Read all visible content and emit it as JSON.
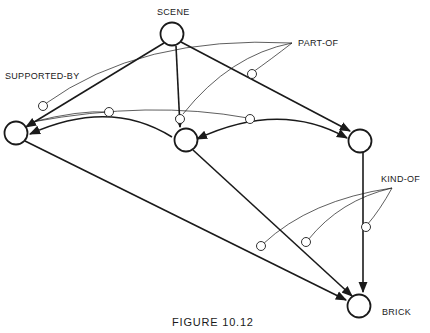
{
  "diagram": {
    "caption": "FIGURE 10.12",
    "nodes": [
      {
        "id": "scene",
        "label": "SCENE"
      },
      {
        "id": "left",
        "label": ""
      },
      {
        "id": "middle",
        "label": ""
      },
      {
        "id": "right",
        "label": ""
      },
      {
        "id": "brick",
        "label": "BRICK"
      }
    ],
    "relation_labels": {
      "part_of": "PART-OF",
      "supported_by": "SUPPORTED-BY",
      "kind_of": "KIND-OF"
    },
    "edges": [
      {
        "from": "scene",
        "to": "left",
        "relation": "PART-OF"
      },
      {
        "from": "scene",
        "to": "middle",
        "relation": "PART-OF"
      },
      {
        "from": "scene",
        "to": "right",
        "relation": "PART-OF"
      },
      {
        "from": "middle",
        "to": "left",
        "relation": "SUPPORTED-BY"
      },
      {
        "from": "middle",
        "to": "right",
        "relation": "SUPPORTED-BY"
      },
      {
        "from": "left",
        "to": "brick",
        "relation": "KIND-OF"
      },
      {
        "from": "middle",
        "to": "brick",
        "relation": "KIND-OF"
      },
      {
        "from": "right",
        "to": "brick",
        "relation": "KIND-OF"
      }
    ],
    "colors": {
      "ink": "#1a1a1a",
      "background": "#ffffff"
    }
  }
}
